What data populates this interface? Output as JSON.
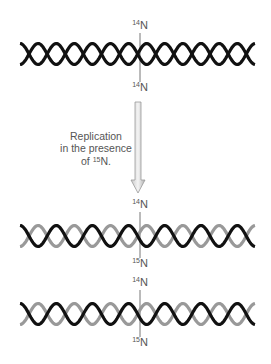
{
  "figure": {
    "type": "meselson-stahl-replication-diagram",
    "parent_molecule": {
      "top_label": {
        "isotope": "14",
        "element": "N"
      },
      "bottom_label": {
        "isotope": "14",
        "element": "N"
      },
      "strand_colors": {
        "top": "#111111",
        "bottom": "#111111"
      }
    },
    "process": {
      "line1": "Replication",
      "line2": "in the presence",
      "line3_prefix": "of ",
      "line3_isotope": "15",
      "line3_element": "N.",
      "arrow": "down-arrow"
    },
    "daughter_molecules": [
      {
        "top_label": {
          "isotope": "14",
          "element": "N"
        },
        "bottom_label": {
          "isotope": "15",
          "element": "N"
        },
        "strand_colors": {
          "old": "#111111",
          "new": "#999999"
        }
      },
      {
        "top_label": {
          "isotope": "14",
          "element": "N"
        },
        "bottom_label": {
          "isotope": "15",
          "element": "N"
        },
        "strand_colors": {
          "old": "#111111",
          "new": "#999999"
        }
      }
    ]
  }
}
